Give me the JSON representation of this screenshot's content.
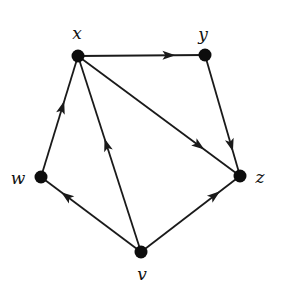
{
  "diagram": {
    "type": "directed-graph",
    "colors": {
      "edge": "#1a1a1a",
      "node": "#0d0d0d",
      "label": "#111111",
      "background": "#ffffff"
    },
    "nodes": [
      {
        "id": "x",
        "label": "x",
        "cx": 78,
        "cy": 56,
        "lx": 77,
        "ly": 33
      },
      {
        "id": "y",
        "label": "y",
        "cx": 205,
        "cy": 55,
        "lx": 203,
        "ly": 34
      },
      {
        "id": "w",
        "label": "w",
        "cx": 41,
        "cy": 177,
        "lx": 18,
        "ly": 178
      },
      {
        "id": "z",
        "label": "z",
        "cx": 240,
        "cy": 176,
        "lx": 260,
        "ly": 177
      },
      {
        "id": "v",
        "label": "v",
        "cx": 141,
        "cy": 252,
        "lx": 142,
        "ly": 274
      }
    ],
    "edges": [
      {
        "from": "x",
        "to": "y",
        "arrow_t": 0.72
      },
      {
        "from": "y",
        "to": "z",
        "arrow_t": 0.75
      },
      {
        "from": "x",
        "to": "z",
        "arrow_t": 0.75
      },
      {
        "from": "w",
        "to": "x",
        "arrow_t": 0.58
      },
      {
        "from": "v",
        "to": "x",
        "arrow_t": 0.55
      },
      {
        "from": "v",
        "to": "w",
        "arrow_t": 0.75
      },
      {
        "from": "v",
        "to": "z",
        "arrow_t": 0.75
      }
    ]
  }
}
